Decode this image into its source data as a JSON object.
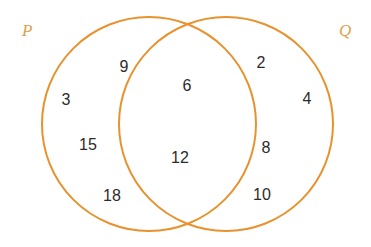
{
  "figure": {
    "type": "venn-diagram",
    "background_color": "#ffffff",
    "stroke_color": "#e8922e",
    "number_color": "#2b2b2b",
    "label_color": "#e0a24a",
    "width": 371,
    "height": 247
  },
  "sets": {
    "left": {
      "label": "P",
      "label_x": 22,
      "label_y": 22,
      "circle": {
        "cx": 149,
        "cy": 124,
        "r": 107
      }
    },
    "right": {
      "label": "Q",
      "label_x": 339,
      "label_y": 22,
      "circle": {
        "cx": 226,
        "cy": 124,
        "r": 107
      }
    }
  },
  "chart_data": {
    "type": "venn",
    "title": "",
    "set_labels": [
      "P",
      "Q"
    ],
    "regions": [
      {
        "name": "P only",
        "set": "P",
        "values": [
          9,
          3,
          15,
          18
        ],
        "count": 4
      },
      {
        "name": "P and Q",
        "set": "P∩Q",
        "values": [
          6,
          12
        ],
        "count": 2
      },
      {
        "name": "Q only",
        "set": "Q",
        "values": [
          2,
          4,
          8,
          10
        ],
        "count": 4
      }
    ]
  },
  "elements": [
    {
      "value": "9",
      "x": 124,
      "y": 67,
      "region": "P-only"
    },
    {
      "value": "3",
      "x": 66,
      "y": 100,
      "region": "P-only"
    },
    {
      "value": "15",
      "x": 88,
      "y": 145,
      "region": "P-only"
    },
    {
      "value": "18",
      "x": 112,
      "y": 196,
      "region": "P-only"
    },
    {
      "value": "6",
      "x": 187,
      "y": 86,
      "region": "P-and-Q"
    },
    {
      "value": "12",
      "x": 180,
      "y": 158,
      "region": "P-and-Q"
    },
    {
      "value": "2",
      "x": 261,
      "y": 63,
      "region": "Q-only"
    },
    {
      "value": "4",
      "x": 307,
      "y": 99,
      "region": "Q-only"
    },
    {
      "value": "8",
      "x": 266,
      "y": 148,
      "region": "Q-only"
    },
    {
      "value": "10",
      "x": 262,
      "y": 195,
      "region": "Q-only"
    }
  ]
}
